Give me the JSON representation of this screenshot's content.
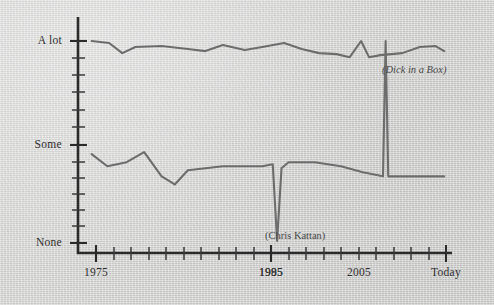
{
  "chart_data": {
    "type": "line",
    "title": "",
    "subtitle": "",
    "xlabel": "",
    "ylabel": "",
    "background_color": "#d4d4d3",
    "line_color": "#6d6d6d",
    "axis_color": "#2b2b2b",
    "grid": false,
    "legend_position": "none",
    "x_axis": {
      "tick_labels": [
        "1975",
        "1985",
        "1995",
        "2005",
        "Today"
      ],
      "tick_label_positions": [
        1975,
        1985,
        1995,
        2005,
        2015
      ],
      "minor_tick_spacing_years": 1,
      "range": [
        1973,
        2016
      ]
    },
    "y_axis": {
      "tick_labels": [
        "None",
        "Some",
        "A lot"
      ],
      "tick_label_values": [
        0,
        50,
        100
      ],
      "minor_ticks": 12,
      "range": [
        0,
        108
      ]
    },
    "series": [
      {
        "name": "upper-series",
        "x": [
          1974.5,
          1976.5,
          1978.0,
          1979.5,
          1982.5,
          1985.5,
          1987.5,
          1989.5,
          1992.0,
          1994.0,
          1996.5,
          1998.5,
          2000.5,
          2002.5,
          2004.0,
          2005.3,
          2006.2,
          2007.5,
          2010.0,
          2012.0,
          2013.8,
          2014.8
        ],
        "y": [
          100,
          99,
          94,
          97,
          97.5,
          96,
          95,
          98,
          95.5,
          97,
          99,
          96,
          94,
          93.5,
          92,
          100,
          92,
          93,
          94,
          97,
          97.5,
          95
        ]
      },
      {
        "name": "lower-series",
        "x": [
          1974.5,
          1976.3,
          1978.5,
          1980.5,
          1982.5,
          1984.0,
          1985.5,
          1987.5,
          1989.5,
          1991.5,
          1994.0,
          1995.2,
          1995.7,
          1996.2,
          1997.0,
          2000.0,
          2003.0,
          2005.5,
          2007.8,
          2008.1,
          2008.4,
          2010.5,
          2014.8
        ],
        "y": [
          44,
          38,
          40,
          45,
          33,
          29,
          36,
          37,
          38,
          38,
          38,
          39,
          1,
          37,
          40,
          40,
          38,
          35,
          33,
          100,
          33,
          33,
          33
        ]
      }
    ],
    "annotations": [
      {
        "name": "dick-in-a-box",
        "text": "(Dick in a Box)",
        "style": "italic",
        "x_px": 382,
        "y_px": 64
      },
      {
        "name": "chris-kattan",
        "text": "(Chris Kattan)",
        "style": "normal",
        "x_px": 265,
        "y_px": 230
      }
    ]
  }
}
